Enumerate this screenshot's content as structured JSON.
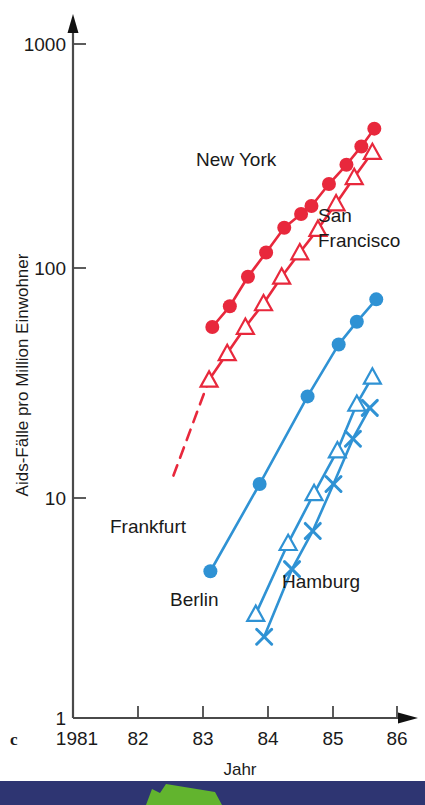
{
  "figure": {
    "panel_letter": "c",
    "background": "#ffffff"
  },
  "chart_data": {
    "type": "line",
    "title": "",
    "subtitle": "",
    "xlabel": "Jahr",
    "ylabel": "Aids-Fälle pro Million Einwohner",
    "yscale": "log",
    "xscale": "linear",
    "grid": false,
    "legend_position": "inline-annotations",
    "xlim": [
      1981,
      1986
    ],
    "ylim": [
      1,
      1000
    ],
    "xticks": [
      1981,
      1982,
      1983,
      1984,
      1985,
      1986
    ],
    "xticklabels": [
      "1981",
      "82",
      "83",
      "84",
      "85",
      "86"
    ],
    "yticks": [
      1,
      10,
      100,
      1000
    ],
    "yticklabels": [
      "1",
      "10",
      "100",
      "1000"
    ],
    "colors": {
      "red": "#e8283c",
      "blue": "#2f92d4",
      "axis": "#4a4a4a",
      "text": "#1a1a1a",
      "band": "#2e3572",
      "band_shape": "#62b42e"
    },
    "series": [
      {
        "name": "New York",
        "color": "#e8283c",
        "marker": "filled-circle",
        "label_x": 1983.55,
        "label_y": 230,
        "x": [
          1983.15,
          1983.42,
          1983.7,
          1983.98,
          1984.26,
          1984.52,
          1984.68,
          1984.95,
          1985.22,
          1985.45,
          1985.65
        ],
        "values": [
          55,
          68,
          92,
          118,
          152,
          175,
          190,
          238,
          290,
          350,
          420
        ]
      },
      {
        "name": "San Francisco",
        "color": "#e8283c",
        "marker": "open-triangle",
        "label_x": 1984.65,
        "label_y": 148,
        "x": [
          1983.1,
          1983.38,
          1983.66,
          1983.94,
          1984.22,
          1984.5,
          1984.78,
          1985.06,
          1985.34,
          1985.62
        ],
        "values": [
          32,
          42,
          55,
          70,
          92,
          118,
          150,
          195,
          255,
          330
        ],
        "extrapolation_dashed": true,
        "extrapolation_x": [
          1982.55,
          1983.1
        ],
        "extrapolation_values": [
          12,
          32
        ]
      },
      {
        "name": "Frankfurt",
        "color": "#2f92d4",
        "marker": "filled-circle",
        "label_x": 1982.55,
        "label_y": 7.2,
        "x": [
          1983.12,
          1983.88,
          1984.62,
          1985.1,
          1985.38,
          1985.68
        ],
        "values": [
          4.5,
          11,
          27,
          46,
          58,
          73
        ]
      },
      {
        "name": "Berlin",
        "color": "#2f92d4",
        "marker": "open-triangle",
        "label_x": 1983.3,
        "label_y": 2.9,
        "x": [
          1983.82,
          1984.32,
          1984.72,
          1985.08,
          1985.38,
          1985.62
        ],
        "values": [
          2.9,
          6.0,
          10.0,
          15.5,
          25,
          33
        ]
      },
      {
        "name": "Hamburg",
        "color": "#2f92d4",
        "marker": "cross",
        "label_x": 1984.45,
        "label_y": 3.0,
        "x": [
          1983.95,
          1984.38,
          1984.7,
          1985.02,
          1985.32,
          1985.58
        ],
        "values": [
          2.3,
          4.6,
          6.8,
          11.0,
          17.5,
          24
        ]
      }
    ],
    "annotations": [
      {
        "text": "New York",
        "series": "New York"
      },
      {
        "text": "San",
        "series": "San Francisco"
      },
      {
        "text": "Francisco",
        "series": "San Francisco"
      },
      {
        "text": "Frankfurt",
        "series": "Frankfurt"
      },
      {
        "text": "Berlin",
        "series": "Berlin"
      },
      {
        "text": "Hamburg",
        "series": "Hamburg"
      }
    ]
  }
}
